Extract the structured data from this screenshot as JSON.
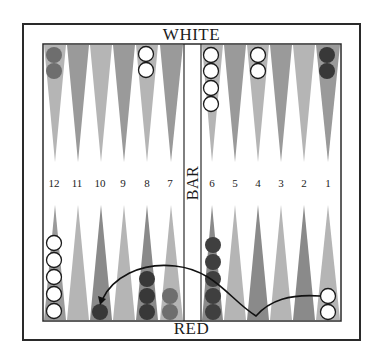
{
  "labels": {
    "top": "WHITE",
    "bottom": "RED",
    "bar": "BAR"
  },
  "point_numbers": {
    "left": [
      "12",
      "11",
      "10",
      "9",
      "8",
      "7"
    ],
    "right": [
      "6",
      "5",
      "4",
      "3",
      "2",
      "1"
    ]
  },
  "colors": {
    "frame": "#2a2a2a",
    "point_light": "#b8b8b8",
    "point_dark": "#8e8e8e",
    "checker_white": "#ffffff",
    "checker_red_dark": "#3a3a3a",
    "checker_red_light": "#6e6e6e",
    "arrow": "#111111"
  },
  "checkers": {
    "top": [
      {
        "point": "12",
        "count": 2,
        "color": "red_light"
      },
      {
        "point": "8",
        "count": 2,
        "color": "white"
      },
      {
        "point": "6",
        "count": 4,
        "color": "white"
      },
      {
        "point": "4",
        "count": 2,
        "color": "white"
      },
      {
        "point": "1",
        "count": 2,
        "color": "red_dark"
      }
    ],
    "bottom": [
      {
        "point": "12",
        "count": 5,
        "color": "white"
      },
      {
        "point": "10",
        "count": 1,
        "color": "red_dark"
      },
      {
        "point": "8",
        "count": 3,
        "color": "red_dark"
      },
      {
        "point": "7",
        "count": 2,
        "color": "red_light"
      },
      {
        "point": "6",
        "count": 5,
        "color": "red_dark"
      },
      {
        "point": "1",
        "count": 2,
        "color": "white"
      }
    ]
  },
  "arrow": {
    "from_point": "1",
    "via_point": "4",
    "to_point": "10"
  }
}
